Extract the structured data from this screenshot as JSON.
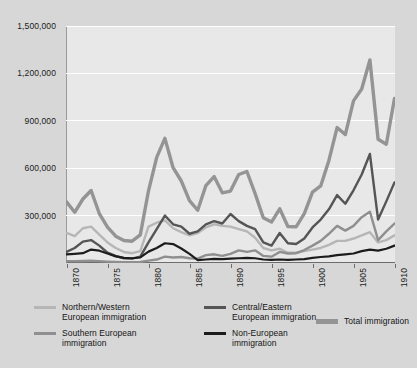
{
  "chart_data": {
    "type": "line",
    "title": "",
    "xlabel": "",
    "ylabel": "",
    "xlim": [
      1870,
      1910
    ],
    "ylim": [
      0,
      1500000
    ],
    "grid": true,
    "legend_position": "bottom",
    "y_ticks": [
      1500000,
      1200000,
      900000,
      600000,
      300000
    ],
    "y_tick_labels": [
      "1,500,000",
      "1,200,000",
      "900,000",
      "600,000",
      "300,000"
    ],
    "x_ticks": [
      1870,
      1875,
      1880,
      1885,
      1890,
      1895,
      1900,
      1905,
      1910
    ],
    "x_tick_labels": [
      "1870",
      "1875",
      "1880",
      "1885",
      "1890",
      "1895",
      "1900",
      "1905",
      "1910"
    ],
    "x": [
      1870,
      1871,
      1872,
      1873,
      1874,
      1875,
      1876,
      1877,
      1878,
      1879,
      1880,
      1881,
      1882,
      1883,
      1884,
      1885,
      1886,
      1887,
      1888,
      1889,
      1890,
      1891,
      1892,
      1893,
      1894,
      1895,
      1896,
      1897,
      1898,
      1899,
      1900,
      1901,
      1902,
      1903,
      1904,
      1905,
      1906,
      1907,
      1908,
      1909,
      1910
    ],
    "series": [
      {
        "name": "Northern/Western European immigration",
        "color": "#b6b6b6",
        "width": 2.4,
        "values": [
          190000,
          170000,
          220000,
          230000,
          180000,
          130000,
          95000,
          70000,
          62000,
          75000,
          230000,
          255000,
          270000,
          220000,
          195000,
          175000,
          190000,
          225000,
          245000,
          235000,
          230000,
          215000,
          200000,
          160000,
          95000,
          80000,
          90000,
          65000,
          65000,
          75000,
          85000,
          95000,
          115000,
          140000,
          140000,
          155000,
          175000,
          195000,
          130000,
          145000,
          175000
        ]
      },
      {
        "name": "Southern European immigration",
        "color": "#8f8f8f",
        "width": 2.4,
        "values": [
          12000,
          12000,
          13000,
          15000,
          12000,
          9000,
          7000,
          5000,
          5000,
          7000,
          15000,
          22000,
          40000,
          35000,
          38000,
          30000,
          28000,
          50000,
          55000,
          45000,
          58000,
          80000,
          70000,
          80000,
          45000,
          40000,
          70000,
          60000,
          62000,
          82000,
          110000,
          140000,
          185000,
          235000,
          205000,
          235000,
          290000,
          325000,
          145000,
          200000,
          250000
        ]
      },
      {
        "name": "Central/Eastern European immigration",
        "color": "#555555",
        "width": 2.4,
        "values": [
          70000,
          95000,
          135000,
          145000,
          110000,
          65000,
          45000,
          30000,
          28000,
          40000,
          130000,
          215000,
          300000,
          245000,
          230000,
          185000,
          200000,
          245000,
          265000,
          250000,
          310000,
          265000,
          235000,
          215000,
          130000,
          110000,
          190000,
          125000,
          120000,
          155000,
          225000,
          275000,
          340000,
          430000,
          375000,
          460000,
          560000,
          690000,
          275000,
          390000,
          510000
        ]
      },
      {
        "name": "Non-European immigration",
        "color": "#1c1c1c",
        "width": 2.2,
        "values": [
          55000,
          58000,
          62000,
          85000,
          78000,
          60000,
          42000,
          32000,
          30000,
          35000,
          72000,
          95000,
          125000,
          120000,
          92000,
          58000,
          18000,
          22000,
          26000,
          25000,
          28000,
          30000,
          32000,
          30000,
          22000,
          20000,
          22000,
          20000,
          22000,
          25000,
          32000,
          38000,
          42000,
          50000,
          55000,
          60000,
          75000,
          85000,
          78000,
          90000,
          110000
        ]
      },
      {
        "name": "Total immigration",
        "color": "#949494",
        "width": 3.4,
        "values": [
          387000,
          321000,
          405000,
          459000,
          313000,
          227000,
          170000,
          142000,
          138000,
          178000,
          457000,
          669000,
          789000,
          603000,
          519000,
          395000,
          334000,
          490000,
          547000,
          444000,
          455000,
          560000,
          579000,
          440000,
          286000,
          259000,
          343000,
          231000,
          229000,
          312000,
          449000,
          488000,
          649000,
          857000,
          813000,
          1026000,
          1101000,
          1285000,
          783000,
          752000,
          1041000
        ]
      }
    ]
  },
  "axis": {
    "y_labels": [
      "1,500,000",
      "1,200,000",
      "900,000",
      "600,000",
      "300,000"
    ],
    "x_labels": [
      "1870",
      "1875",
      "1880",
      "1885",
      "1890",
      "1895",
      "1900",
      "1905",
      "1910"
    ]
  },
  "legend": {
    "items": [
      {
        "id": "northern-western",
        "label": "Northern/Western\nEuropean immigration",
        "color": "#b6b6b6",
        "thick": false
      },
      {
        "id": "central-eastern",
        "label": "Central/Eastern\nEuropean immigration",
        "color": "#555555",
        "thick": false
      },
      {
        "id": "southern",
        "label": "Southern European\nimmigration",
        "color": "#8f8f8f",
        "thick": false
      },
      {
        "id": "non-european",
        "label": "Non-European\nimmigration",
        "color": "#1c1c1c",
        "thick": false
      },
      {
        "id": "total",
        "label": "Total immigration",
        "color": "#949494",
        "thick": true
      }
    ]
  },
  "colors": {
    "page_background": "#d7d7d7",
    "plot_background": "#e8e8e8",
    "gridline": "#ffffff",
    "axis": "#6d6d6d",
    "text": "#1b1b1b"
  }
}
